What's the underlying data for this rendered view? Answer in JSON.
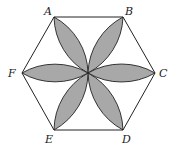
{
  "diagram": {
    "type": "geometry",
    "colors": {
      "stroke": "#222222",
      "petal_fill": "#a8a8a8",
      "background": "#ffffff"
    },
    "center": {
      "x": 88,
      "y": 73
    },
    "vertices": [
      {
        "label": "A",
        "x": 54,
        "y": 17,
        "lx": 44,
        "ly": 15
      },
      {
        "label": "B",
        "x": 123,
        "y": 17,
        "lx": 125,
        "ly": 15
      },
      {
        "label": "C",
        "x": 155,
        "y": 73,
        "lx": 159,
        "ly": 77
      },
      {
        "label": "D",
        "x": 123,
        "y": 130,
        "lx": 122,
        "ly": 143
      },
      {
        "label": "E",
        "x": 54,
        "y": 130,
        "lx": 45,
        "ly": 143
      },
      {
        "label": "F",
        "x": 22,
        "y": 73,
        "lx": 8,
        "ly": 77
      }
    ]
  }
}
